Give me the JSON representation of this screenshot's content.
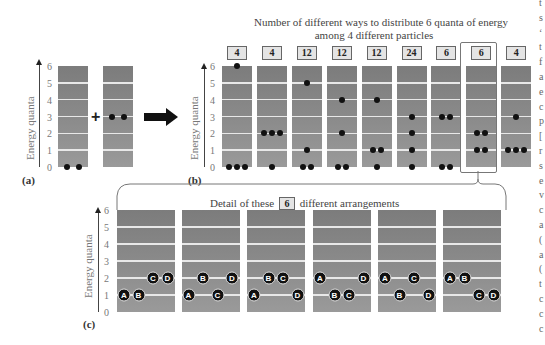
{
  "figure": {
    "panel_a": {
      "label": "(a)",
      "ylabel": "Energy quanta",
      "ticks": [
        "0",
        "1",
        "2",
        "3",
        "4",
        "5",
        "6"
      ],
      "plus": "+",
      "columns": [
        {
          "particles": [
            0,
            0
          ]
        },
        {
          "particles": [
            3,
            3
          ]
        }
      ]
    },
    "panel_b": {
      "label": "(b)",
      "title_line1": "Number of different ways to distribute 6 quanta of energy",
      "title_line2": "among 4 different particles",
      "ylabel": "Energy quanta",
      "ticks": [
        "0",
        "1",
        "2",
        "3",
        "4",
        "5",
        "6"
      ],
      "highlighted_index": 7,
      "columns": [
        {
          "count": "4",
          "levels": [
            0,
            0,
            0,
            6
          ]
        },
        {
          "count": "4",
          "levels": [
            2,
            2,
            2,
            0
          ]
        },
        {
          "count": "12",
          "levels": [
            0,
            0,
            1,
            5
          ]
        },
        {
          "count": "12",
          "levels": [
            0,
            0,
            2,
            4
          ]
        },
        {
          "count": "12",
          "levels": [
            0,
            1,
            1,
            4
          ]
        },
        {
          "count": "24",
          "levels": [
            0,
            1,
            2,
            3
          ]
        },
        {
          "count": "6",
          "levels": [
            0,
            0,
            3,
            3
          ]
        },
        {
          "count": "6",
          "levels": [
            1,
            1,
            2,
            2
          ]
        },
        {
          "count": "4",
          "levels": [
            1,
            1,
            1,
            3
          ]
        }
      ]
    },
    "panel_c": {
      "label": "(c)",
      "ylabel": "Energy quanta",
      "ticks": [
        "0",
        "1",
        "2",
        "3",
        "4",
        "5",
        "6"
      ],
      "detail_prefix": "Detail of these",
      "detail_count": "6",
      "detail_suffix": "different arrangements",
      "arrangements": [
        {
          "level1": [
            "A",
            "B"
          ],
          "level2": [
            "C",
            "D"
          ]
        },
        {
          "level1": [
            "A",
            "C"
          ],
          "level2": [
            "B",
            "D"
          ]
        },
        {
          "level1": [
            "A",
            "D"
          ],
          "level2": [
            "B",
            "C"
          ]
        },
        {
          "level1": [
            "B",
            "C"
          ],
          "level2": [
            "A",
            "D"
          ]
        },
        {
          "level1": [
            "B",
            "D"
          ],
          "level2": [
            "A",
            "C"
          ]
        },
        {
          "level1": [
            "C",
            "D"
          ],
          "level2": [
            "A",
            "B"
          ]
        }
      ]
    },
    "edge_text": [
      "t",
      "s",
      "‘",
      "t",
      "f",
      "a",
      "e",
      "c",
      "p",
      "[",
      "r",
      "s",
      "e",
      "v",
      "c",
      "a",
      "(",
      "a",
      "(",
      "t",
      "c",
      "c",
      "c"
    ]
  }
}
